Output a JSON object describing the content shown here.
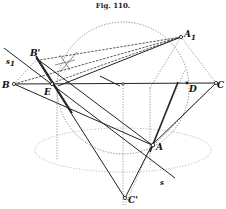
{
  "figure": {
    "title": "Fig. 110.",
    "labels": {
      "B": "B",
      "B1": "B'",
      "E": "E",
      "A1": "A",
      "A1_sub": "1",
      "D": "D",
      "C": "C",
      "A": "A",
      "C1": "C'",
      "s1": "s",
      "s1_sub": "1",
      "s": "s"
    },
    "colors": {
      "ink": "#222222",
      "background": "#ffffff"
    }
  }
}
